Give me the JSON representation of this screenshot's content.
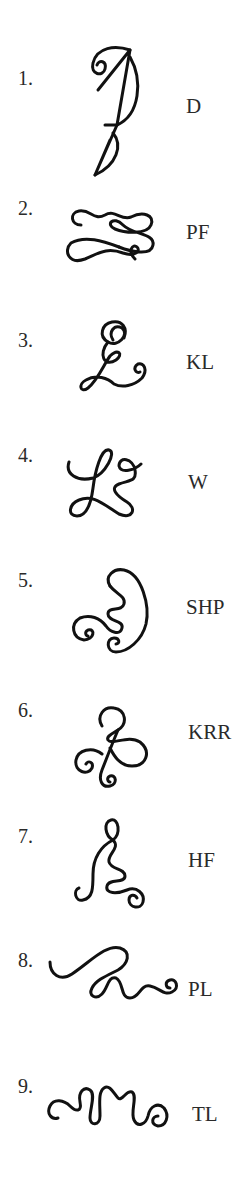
{
  "items": [
    {
      "number": "1.",
      "label": "D",
      "glyph": "sigil-d-icon"
    },
    {
      "number": "2.",
      "label": "PF",
      "glyph": "sigil-pf-icon"
    },
    {
      "number": "3.",
      "label": "KL",
      "glyph": "sigil-kl-icon"
    },
    {
      "number": "4.",
      "label": "W",
      "glyph": "sigil-w-icon"
    },
    {
      "number": "5.",
      "label": "SHP",
      "glyph": "sigil-shp-icon"
    },
    {
      "number": "6.",
      "label": "KRR",
      "glyph": "sigil-krr-icon"
    },
    {
      "number": "7.",
      "label": "HF",
      "glyph": "sigil-hf-icon"
    },
    {
      "number": "8.",
      "label": "PL",
      "glyph": "sigil-pl-icon"
    },
    {
      "number": "9.",
      "label": "TL",
      "glyph": "sigil-tl-icon"
    }
  ]
}
